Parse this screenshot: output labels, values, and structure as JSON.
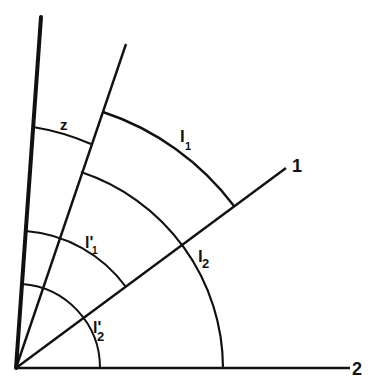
{
  "diagram": {
    "type": "vector-components-angles",
    "colors": {
      "stroke": "#111111",
      "background": "#ffffff"
    },
    "axes": [
      {
        "id": "axis-3",
        "label": ""
      },
      {
        "id": "axis-z-ray",
        "label": ""
      },
      {
        "id": "axis-1",
        "label": "1"
      },
      {
        "id": "axis-2",
        "label": "2"
      }
    ],
    "arcs": [
      {
        "id": "arc-z",
        "label": "z"
      },
      {
        "id": "arc-l1",
        "label": "l",
        "sub": "1"
      },
      {
        "id": "arc-l2",
        "label": "l",
        "sub": "2"
      },
      {
        "id": "arc-l1-prime",
        "label": "l'",
        "sub": "1"
      },
      {
        "id": "arc-l2-prime",
        "label": "l'",
        "sub": "2"
      }
    ]
  }
}
